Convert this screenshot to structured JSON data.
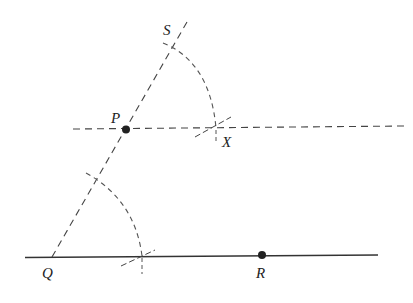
{
  "diagram": {
    "type": "geometric-construction",
    "points": {
      "Q": {
        "label": "Q",
        "x": 52,
        "y": 257
      },
      "R": {
        "label": "R",
        "x": 262,
        "y": 255
      },
      "P": {
        "label": "P",
        "x": 126,
        "y": 129
      },
      "S": {
        "label": "S",
        "x": 172,
        "y": 45
      },
      "X": {
        "label": "X",
        "x": 216,
        "y": 128
      }
    },
    "colors": {
      "ink": "#222222",
      "dash": "#555555"
    }
  }
}
